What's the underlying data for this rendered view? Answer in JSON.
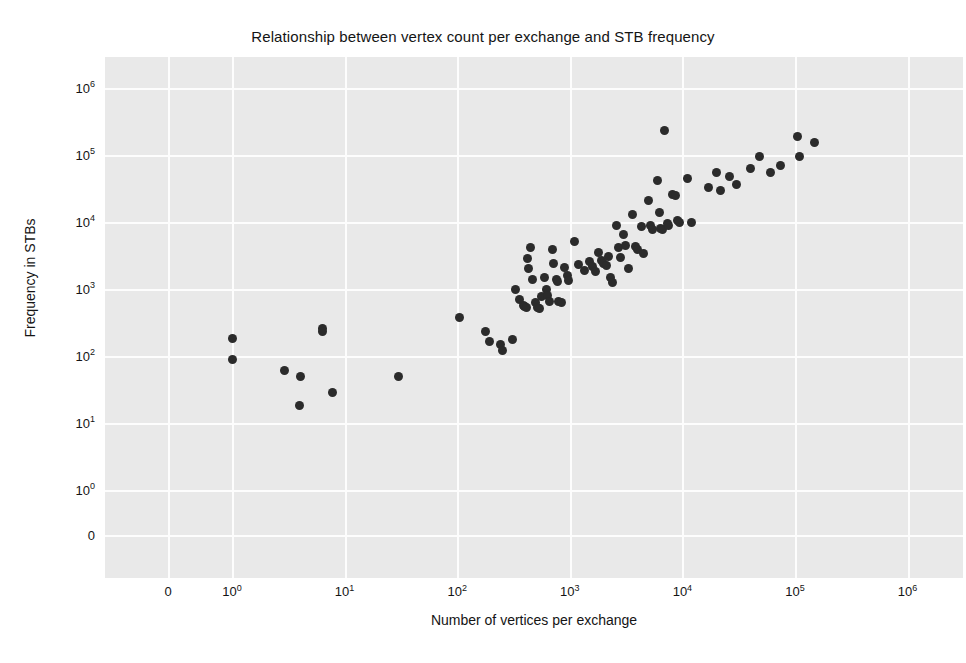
{
  "chart_data": {
    "type": "scatter",
    "title": "Relationship between vertex count per exchange and STB frequency",
    "xlabel": "Number of vertices per exchange",
    "ylabel": "Frequency in STBs",
    "xscale": "log",
    "yscale": "log",
    "xlim": [
      0.2,
      1000000
    ],
    "ylim": [
      0.2,
      1000000
    ],
    "grid": true,
    "legend": null,
    "marker": {
      "shape": "circle",
      "color": "#2b2b2b",
      "size": 9
    },
    "xticks": [
      {
        "label": "0",
        "value": 0.22
      },
      {
        "label": "10⁰",
        "value": 1
      },
      {
        "label": "10¹",
        "value": 10
      },
      {
        "label": "10²",
        "value": 100
      },
      {
        "label": "10³",
        "value": 1000
      },
      {
        "label": "10⁴",
        "value": 10000
      },
      {
        "label": "10⁵",
        "value": 100000
      },
      {
        "label": "10⁶",
        "value": 1000000
      }
    ],
    "yticks": [
      {
        "label": "10⁶",
        "value": 1000000
      },
      {
        "label": "10⁵",
        "value": 100000
      },
      {
        "label": "10⁴",
        "value": 10000
      },
      {
        "label": "10³",
        "value": 1000
      },
      {
        "label": "10²",
        "value": 100
      },
      {
        "label": "10¹",
        "value": 10
      },
      {
        "label": "10⁰",
        "value": 1
      },
      {
        "label": "0",
        "value": 0.22
      }
    ],
    "points": [
      [
        1.0,
        180
      ],
      [
        1.0,
        90
      ],
      [
        2.9,
        60
      ],
      [
        4.1,
        50
      ],
      [
        4.0,
        18
      ],
      [
        6.4,
        260
      ],
      [
        6.4,
        230
      ],
      [
        7.8,
        29
      ],
      [
        30,
        50
      ],
      [
        105,
        370
      ],
      [
        180,
        230
      ],
      [
        195,
        165
      ],
      [
        240,
        150
      ],
      [
        250,
        120
      ],
      [
        310,
        175
      ],
      [
        330,
        1000
      ],
      [
        360,
        700
      ],
      [
        390,
        560
      ],
      [
        400,
        540
      ],
      [
        410,
        530
      ],
      [
        420,
        2900
      ],
      [
        430,
        2000
      ],
      [
        450,
        4100
      ],
      [
        470,
        1400
      ],
      [
        500,
        620
      ],
      [
        520,
        530
      ],
      [
        540,
        510
      ],
      [
        560,
        760
      ],
      [
        600,
        1500
      ],
      [
        620,
        980
      ],
      [
        640,
        800
      ],
      [
        660,
        640
      ],
      [
        700,
        3900
      ],
      [
        720,
        2400
      ],
      [
        760,
        1400
      ],
      [
        780,
        1300
      ],
      [
        800,
        660
      ],
      [
        850,
        620
      ],
      [
        900,
        2100
      ],
      [
        950,
        1600
      ],
      [
        980,
        1350
      ],
      [
        1100,
        5200
      ],
      [
        1200,
        2300
      ],
      [
        1350,
        1900
      ],
      [
        1500,
        2600
      ],
      [
        1600,
        2200
      ],
      [
        1700,
        1800
      ],
      [
        1800,
        3500
      ],
      [
        1900,
        2700
      ],
      [
        2000,
        2400
      ],
      [
        2100,
        2250
      ],
      [
        2200,
        3100
      ],
      [
        2300,
        1500
      ],
      [
        2400,
        1250
      ],
      [
        2600,
        9000
      ],
      [
        2700,
        4100
      ],
      [
        2800,
        3000
      ],
      [
        3000,
        6400
      ],
      [
        3100,
        4400
      ],
      [
        3300,
        2000
      ],
      [
        3600,
        13000
      ],
      [
        3800,
        4300
      ],
      [
        4000,
        3900
      ],
      [
        4300,
        8500
      ],
      [
        4500,
        3400
      ],
      [
        5000,
        21000
      ],
      [
        5200,
        9000
      ],
      [
        5400,
        7800
      ],
      [
        6000,
        41000
      ],
      [
        6200,
        14000
      ],
      [
        6400,
        8000
      ],
      [
        6600,
        7600
      ],
      [
        7000,
        230000
      ],
      [
        7400,
        9500
      ],
      [
        7600,
        9000
      ],
      [
        8200,
        26000
      ],
      [
        8600,
        25000
      ],
      [
        9000,
        10500
      ],
      [
        9500,
        10000
      ],
      [
        11000,
        45000
      ],
      [
        12000,
        10000
      ],
      [
        17000,
        33000
      ],
      [
        20000,
        55000
      ],
      [
        22000,
        30000
      ],
      [
        26000,
        47000
      ],
      [
        30000,
        36000
      ],
      [
        40000,
        62000
      ],
      [
        48000,
        95000
      ],
      [
        60000,
        55000
      ],
      [
        75000,
        70000
      ],
      [
        105000,
        190000
      ],
      [
        110000,
        95000
      ],
      [
        150000,
        155000
      ]
    ]
  }
}
